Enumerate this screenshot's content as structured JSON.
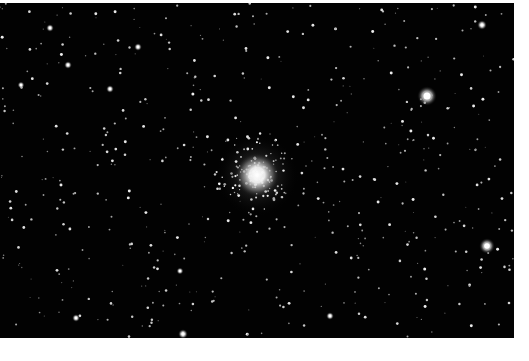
{
  "image": {
    "subject": "globular star cluster",
    "description": "Black-and-white astronomical photograph of a globular cluster surrounded by a dense starfield",
    "background_color": "#020202",
    "page_color": "#ffffff",
    "cluster": {
      "x": 257,
      "y": 172,
      "core_radius": 14,
      "halo_radius": 42
    },
    "bright_stars": [
      {
        "x": 427,
        "y": 93,
        "r": 5
      },
      {
        "x": 487,
        "y": 243,
        "r": 4
      },
      {
        "x": 482,
        "y": 22,
        "r": 2.5
      },
      {
        "x": 183,
        "y": 331,
        "r": 2.5
      },
      {
        "x": 50,
        "y": 25,
        "r": 2
      },
      {
        "x": 68,
        "y": 62,
        "r": 2
      },
      {
        "x": 110,
        "y": 86,
        "r": 2
      },
      {
        "x": 138,
        "y": 44,
        "r": 2
      },
      {
        "x": 76,
        "y": 315,
        "r": 2
      },
      {
        "x": 330,
        "y": 313,
        "r": 2
      },
      {
        "x": 21,
        "y": 82,
        "r": 1.8
      },
      {
        "x": 180,
        "y": 268,
        "r": 1.8
      }
    ],
    "faint_star_count": 520
  }
}
